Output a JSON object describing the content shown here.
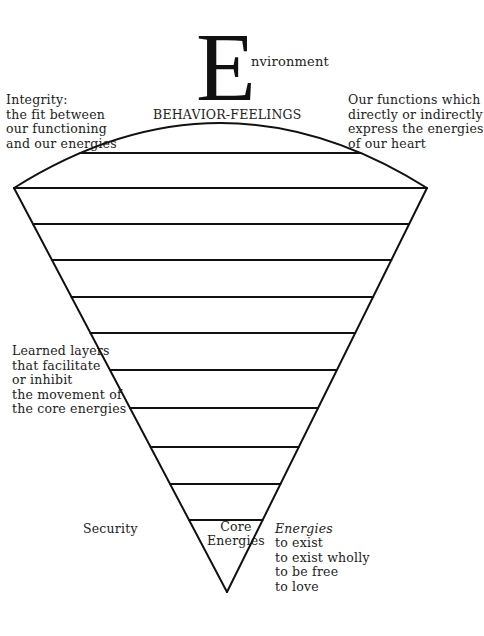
{
  "title": {
    "initial": "E",
    "rest": "nvironment"
  },
  "top_label": "BEHAVIOR-FEELINGS",
  "annotations": {
    "integrity": "Integrity:\nthe fit between\nour functioning\nand our energies",
    "functions": "Our functions which\ndirectly or indirectly\nexpress the energies\nof our heart",
    "learned_layers": "Learned layers\nthat facilitate\nor inhibit\nthe movement of\nthe core energies",
    "security": "Security",
    "core": "Core\nEnergies",
    "energies_heading": "Energies",
    "energies_list": "to exist\nto exist wholly\nto be free\nto love"
  },
  "diagram": {
    "shape": "inverted-cone",
    "stroke_color": "#111111",
    "layer_lines_y": [
      153,
      188,
      224,
      260,
      297,
      333,
      370,
      408,
      447,
      484,
      520
    ],
    "apex": [
      227,
      592
    ],
    "left_corner": [
      14,
      188
    ],
    "right_corner": [
      427,
      188
    ],
    "arc_top_y": 123
  }
}
